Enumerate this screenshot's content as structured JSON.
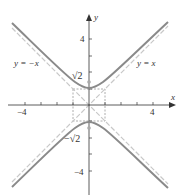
{
  "diagram": {
    "axes": {
      "x_label": "x",
      "y_label": "y",
      "x_ticks": [
        "−4",
        "4"
      ],
      "y_ticks": [
        "4",
        "−4"
      ],
      "x_range": [
        -5,
        5
      ],
      "y_range": [
        -5,
        5
      ]
    },
    "asymptotes": [
      {
        "label": "y = −x",
        "slope": -1
      },
      {
        "label": "y = x",
        "slope": 1
      }
    ],
    "foci": [
      {
        "label": "√2",
        "value": 1.414
      },
      {
        "label": "−√2",
        "value": -1.414
      }
    ],
    "vertices": [
      [
        0,
        1
      ],
      [
        0,
        -1
      ]
    ],
    "rectangle": {
      "x": [
        -1,
        1
      ],
      "y": [
        -1,
        1
      ]
    },
    "colors": {
      "curve": "#8a8a8a",
      "asymptote": "#c8c8c8",
      "axis": "#333333",
      "rect": "#999999"
    }
  }
}
